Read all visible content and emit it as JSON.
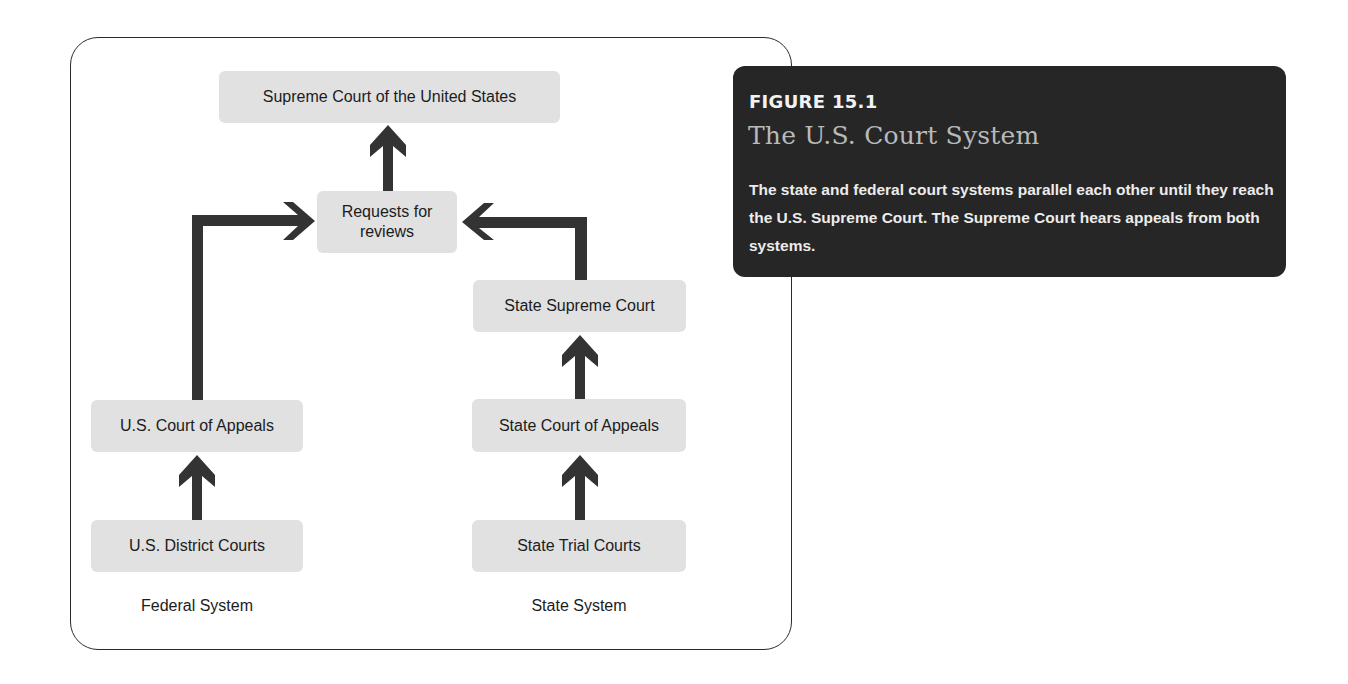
{
  "diagram": {
    "nodes": {
      "supreme_court_us": "Supreme Court of the United States",
      "requests_for_reviews_line1": "Requests for",
      "requests_for_reviews_line2": "reviews",
      "state_supreme_court": "State Supreme Court",
      "us_court_of_appeals": "U.S. Court of Appeals",
      "state_court_of_appeals": "State Court of Appeals",
      "us_district_courts": "U.S. District Courts",
      "state_trial_courts": "State Trial Courts"
    },
    "system_labels": {
      "federal": "Federal System",
      "state": "State System"
    },
    "edges": [
      {
        "from": "U.S. District Courts",
        "to": "U.S. Court of Appeals"
      },
      {
        "from": "U.S. Court of Appeals",
        "to": "Requests for reviews"
      },
      {
        "from": "State Trial Courts",
        "to": "State Court of Appeals"
      },
      {
        "from": "State Court of Appeals",
        "to": "State Supreme Court"
      },
      {
        "from": "State Supreme Court",
        "to": "Requests for reviews"
      },
      {
        "from": "Requests for reviews",
        "to": "Supreme Court of the United States"
      }
    ],
    "colors": {
      "node_fill": "#e1e1e1",
      "arrow": "#333333",
      "caption_bg": "#262626",
      "caption_title": "#b9b9b9"
    }
  },
  "caption": {
    "figure_number": "FIGURE 15.1",
    "title": "The U.S. Court System",
    "body": "The state and federal court systems parallel each other until they reach the U.S. Supreme Court. The Supreme Court hears appeals from both systems."
  }
}
